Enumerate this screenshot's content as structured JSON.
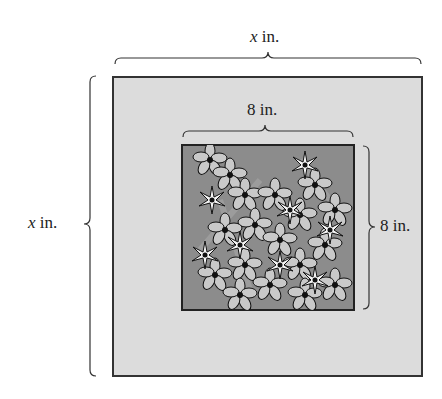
{
  "diagram": {
    "type": "geometry-figure",
    "outer_square": {
      "width_label_var": "x",
      "width_label_unit": " in.",
      "height_label_var": "x",
      "height_label_unit": " in.",
      "fill": "#dcdcdc",
      "border": "#333333"
    },
    "inner_square": {
      "width_label": "8 in.",
      "height_label": "8 in.",
      "fill": "#8c8c8c",
      "border": "#333333",
      "content": "flowers"
    }
  }
}
